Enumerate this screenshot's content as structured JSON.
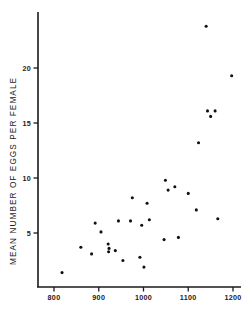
{
  "chart_data": {
    "type": "scatter",
    "title": "",
    "xlabel": "",
    "ylabel": "MEAN NUMBER OF EGGS PER FEMALE",
    "xlim": [
      755,
      1245
    ],
    "ylim": [
      0.4,
      24.6
    ],
    "grid": false,
    "legend": null,
    "xticks": [
      800,
      900,
      1000,
      1100,
      1200
    ],
    "xtick_labels": [
      "800",
      "900",
      "1000",
      "1100",
      "1200"
    ],
    "yticks": [
      5,
      10,
      15,
      20
    ],
    "ytick_labels": [
      "5",
      "10",
      "15",
      "20"
    ],
    "marker": "filled-circle",
    "marker_color": "#111111",
    "marker_size_px": 3.1,
    "axis_color": "#1a1a1a",
    "background": "#ffffff",
    "points": [
      {
        "x": 818,
        "y": 1.4
      },
      {
        "x": 860,
        "y": 3.7
      },
      {
        "x": 884,
        "y": 3.1
      },
      {
        "x": 892,
        "y": 5.9
      },
      {
        "x": 905,
        "y": 5.1
      },
      {
        "x": 921,
        "y": 4.0
      },
      {
        "x": 922,
        "y": 3.3
      },
      {
        "x": 923,
        "y": 3.6
      },
      {
        "x": 937,
        "y": 3.4
      },
      {
        "x": 944,
        "y": 6.1
      },
      {
        "x": 954,
        "y": 2.5
      },
      {
        "x": 971,
        "y": 6.1
      },
      {
        "x": 975,
        "y": 8.2
      },
      {
        "x": 992,
        "y": 2.8
      },
      {
        "x": 996,
        "y": 5.7
      },
      {
        "x": 1001,
        "y": 1.9
      },
      {
        "x": 1008,
        "y": 7.7
      },
      {
        "x": 1013,
        "y": 6.2
      },
      {
        "x": 1046,
        "y": 4.4
      },
      {
        "x": 1049,
        "y": 9.8
      },
      {
        "x": 1055,
        "y": 8.9
      },
      {
        "x": 1070,
        "y": 9.2
      },
      {
        "x": 1078,
        "y": 4.6
      },
      {
        "x": 1100,
        "y": 8.6
      },
      {
        "x": 1118,
        "y": 7.1
      },
      {
        "x": 1123,
        "y": 13.2
      },
      {
        "x": 1140,
        "y": 23.8
      },
      {
        "x": 1143,
        "y": 16.1
      },
      {
        "x": 1150,
        "y": 15.6
      },
      {
        "x": 1160,
        "y": 16.1
      },
      {
        "x": 1166,
        "y": 6.3
      },
      {
        "x": 1197,
        "y": 19.3
      }
    ]
  }
}
